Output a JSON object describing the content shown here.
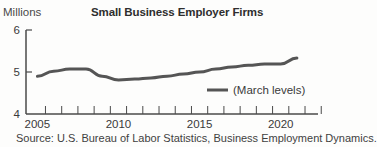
{
  "header": {
    "unit_label": "Millions",
    "title": "Small Business Employer Firms"
  },
  "legend": {
    "label": "(March levels)"
  },
  "source": "Source: U.S. Bureau of Labor Statistics, Business Employment Dynamics.",
  "colors": {
    "line": "#555555",
    "axis": "#4a4a4a",
    "text": "#3a3a3a"
  },
  "chart_data": {
    "type": "line",
    "title": "Small Business Employer Firms",
    "xlabel": "",
    "ylabel": "Millions",
    "x": [
      2005,
      2006,
      2007,
      2008,
      2009,
      2010,
      2011,
      2012,
      2013,
      2014,
      2015,
      2016,
      2017,
      2018,
      2019,
      2020,
      2021
    ],
    "series": [
      {
        "name": "(March levels)",
        "values": [
          4.9,
          5.02,
          5.07,
          5.07,
          4.9,
          4.81,
          4.83,
          4.86,
          4.9,
          4.95,
          5.0,
          5.07,
          5.12,
          5.16,
          5.19,
          5.19,
          5.33
        ]
      }
    ],
    "ylim": [
      4,
      6
    ],
    "yticks": [
      4,
      5,
      6
    ],
    "xticks_labeled": [
      2005,
      2010,
      2015,
      2020
    ],
    "xlim": [
      2004.3,
      2022.3
    ],
    "grid": false,
    "legend_position": "lower right inside plot",
    "annotations": [
      "Source: U.S. Bureau of Labor Statistics, Business Employment Dynamics."
    ]
  }
}
